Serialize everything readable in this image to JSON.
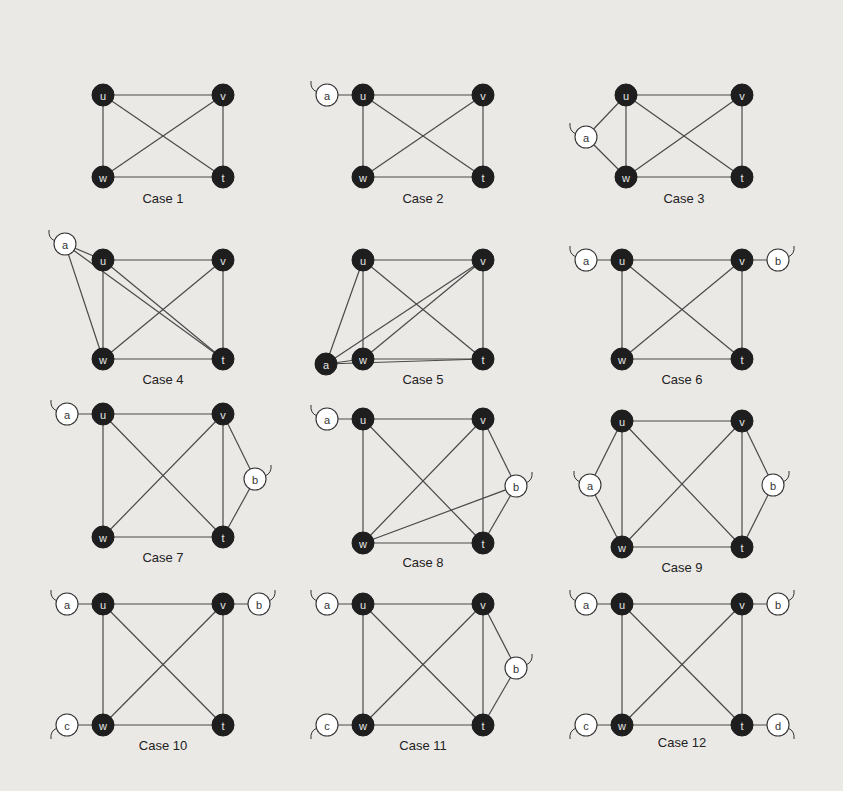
{
  "figure": {
    "core_vertices": [
      "u",
      "v",
      "w",
      "t"
    ],
    "colors": {
      "dark_node": "#1e1e1e",
      "light_node": "#ffffff",
      "edge": "#4a4a4a",
      "background": "#ebe9e6"
    },
    "cases": [
      {
        "label": "Case 1",
        "nodes": [
          {
            "id": "u",
            "x": 103,
            "y": 95,
            "dark": true
          },
          {
            "id": "v",
            "x": 223,
            "y": 95,
            "dark": true
          },
          {
            "id": "w",
            "x": 103,
            "y": 177,
            "dark": true
          },
          {
            "id": "t",
            "x": 223,
            "y": 177,
            "dark": true
          }
        ],
        "edges": [
          [
            "u",
            "v"
          ],
          [
            "u",
            "w"
          ],
          [
            "u",
            "t"
          ],
          [
            "v",
            "w"
          ],
          [
            "v",
            "t"
          ],
          [
            "w",
            "t"
          ]
        ],
        "caption": {
          "x": 163,
          "y": 203
        }
      },
      {
        "label": "Case 2",
        "nodes": [
          {
            "id": "a",
            "x": 327,
            "y": 95,
            "dark": false,
            "tail": "ul"
          },
          {
            "id": "u",
            "x": 363,
            "y": 95,
            "dark": true
          },
          {
            "id": "v",
            "x": 483,
            "y": 95,
            "dark": true
          },
          {
            "id": "w",
            "x": 363,
            "y": 177,
            "dark": true
          },
          {
            "id": "t",
            "x": 483,
            "y": 177,
            "dark": true
          }
        ],
        "edges": [
          [
            "a",
            "u"
          ],
          [
            "u",
            "v"
          ],
          [
            "u",
            "w"
          ],
          [
            "u",
            "t"
          ],
          [
            "v",
            "w"
          ],
          [
            "v",
            "t"
          ],
          [
            "w",
            "t"
          ]
        ],
        "caption": {
          "x": 423,
          "y": 203
        }
      },
      {
        "label": "Case 3",
        "nodes": [
          {
            "id": "a",
            "x": 586,
            "y": 137,
            "dark": false,
            "tail": "ul"
          },
          {
            "id": "u",
            "x": 626,
            "y": 95,
            "dark": true
          },
          {
            "id": "v",
            "x": 742,
            "y": 95,
            "dark": true
          },
          {
            "id": "w",
            "x": 626,
            "y": 177,
            "dark": true
          },
          {
            "id": "t",
            "x": 742,
            "y": 177,
            "dark": true
          }
        ],
        "edges": [
          [
            "a",
            "u"
          ],
          [
            "a",
            "w"
          ],
          [
            "u",
            "v"
          ],
          [
            "u",
            "w"
          ],
          [
            "u",
            "t"
          ],
          [
            "v",
            "w"
          ],
          [
            "v",
            "t"
          ],
          [
            "w",
            "t"
          ]
        ],
        "caption": {
          "x": 684,
          "y": 203
        }
      },
      {
        "label": "Case 4",
        "nodes": [
          {
            "id": "a",
            "x": 65,
            "y": 244,
            "dark": false,
            "tail": "ul"
          },
          {
            "id": "u",
            "x": 103,
            "y": 260,
            "dark": true
          },
          {
            "id": "v",
            "x": 223,
            "y": 260,
            "dark": true
          },
          {
            "id": "w",
            "x": 103,
            "y": 359,
            "dark": true
          },
          {
            "id": "t",
            "x": 223,
            "y": 359,
            "dark": true
          }
        ],
        "edges": [
          [
            "a",
            "u"
          ],
          [
            "a",
            "w"
          ],
          [
            "a",
            "t"
          ],
          [
            "u",
            "v"
          ],
          [
            "u",
            "w"
          ],
          [
            "u",
            "t"
          ],
          [
            "v",
            "w"
          ],
          [
            "v",
            "t"
          ],
          [
            "w",
            "t"
          ]
        ],
        "caption": {
          "x": 163,
          "y": 384
        }
      },
      {
        "label": "Case 5",
        "nodes": [
          {
            "id": "a",
            "x": 326,
            "y": 364,
            "dark": true
          },
          {
            "id": "u",
            "x": 363,
            "y": 260,
            "dark": true
          },
          {
            "id": "v",
            "x": 483,
            "y": 260,
            "dark": true
          },
          {
            "id": "w",
            "x": 363,
            "y": 359,
            "dark": true
          },
          {
            "id": "t",
            "x": 483,
            "y": 359,
            "dark": true
          }
        ],
        "edges": [
          [
            "a",
            "u"
          ],
          [
            "a",
            "w"
          ],
          [
            "a",
            "v"
          ],
          [
            "a",
            "t"
          ],
          [
            "u",
            "v"
          ],
          [
            "u",
            "w"
          ],
          [
            "u",
            "t"
          ],
          [
            "v",
            "w"
          ],
          [
            "v",
            "t"
          ],
          [
            "w",
            "t"
          ]
        ],
        "caption": {
          "x": 423,
          "y": 384
        }
      },
      {
        "label": "Case 6",
        "nodes": [
          {
            "id": "a",
            "x": 586,
            "y": 260,
            "dark": false,
            "tail": "ul"
          },
          {
            "id": "u",
            "x": 622,
            "y": 260,
            "dark": true
          },
          {
            "id": "v",
            "x": 742,
            "y": 260,
            "dark": true
          },
          {
            "id": "b",
            "x": 778,
            "y": 260,
            "dark": false,
            "tail": "ur"
          },
          {
            "id": "w",
            "x": 622,
            "y": 359,
            "dark": true
          },
          {
            "id": "t",
            "x": 742,
            "y": 359,
            "dark": true
          }
        ],
        "edges": [
          [
            "a",
            "u"
          ],
          [
            "v",
            "b"
          ],
          [
            "u",
            "v"
          ],
          [
            "u",
            "w"
          ],
          [
            "u",
            "t"
          ],
          [
            "v",
            "w"
          ],
          [
            "v",
            "t"
          ],
          [
            "w",
            "t"
          ]
        ],
        "caption": {
          "x": 682,
          "y": 384
        }
      },
      {
        "label": "Case 7",
        "nodes": [
          {
            "id": "a",
            "x": 67,
            "y": 414,
            "dark": false,
            "tail": "ul"
          },
          {
            "id": "u",
            "x": 103,
            "y": 414,
            "dark": true
          },
          {
            "id": "v",
            "x": 223,
            "y": 414,
            "dark": true
          },
          {
            "id": "b",
            "x": 255,
            "y": 479,
            "dark": false,
            "tail": "ur"
          },
          {
            "id": "w",
            "x": 103,
            "y": 537,
            "dark": true
          },
          {
            "id": "t",
            "x": 223,
            "y": 537,
            "dark": true
          }
        ],
        "edges": [
          [
            "a",
            "u"
          ],
          [
            "v",
            "b"
          ],
          [
            "b",
            "t"
          ],
          [
            "u",
            "v"
          ],
          [
            "u",
            "w"
          ],
          [
            "u",
            "t"
          ],
          [
            "v",
            "w"
          ],
          [
            "v",
            "t"
          ],
          [
            "w",
            "t"
          ]
        ],
        "caption": {
          "x": 163,
          "y": 562
        }
      },
      {
        "label": "Case 8",
        "nodes": [
          {
            "id": "a",
            "x": 327,
            "y": 419,
            "dark": false,
            "tail": "ul"
          },
          {
            "id": "u",
            "x": 363,
            "y": 419,
            "dark": true
          },
          {
            "id": "v",
            "x": 483,
            "y": 419,
            "dark": true
          },
          {
            "id": "b",
            "x": 516,
            "y": 486,
            "dark": false,
            "tail": "ur"
          },
          {
            "id": "w",
            "x": 363,
            "y": 543,
            "dark": true
          },
          {
            "id": "t",
            "x": 483,
            "y": 543,
            "dark": true
          }
        ],
        "edges": [
          [
            "a",
            "u"
          ],
          [
            "v",
            "b"
          ],
          [
            "b",
            "t"
          ],
          [
            "b",
            "w"
          ],
          [
            "u",
            "v"
          ],
          [
            "u",
            "w"
          ],
          [
            "u",
            "t"
          ],
          [
            "v",
            "w"
          ],
          [
            "v",
            "t"
          ],
          [
            "w",
            "t"
          ]
        ],
        "caption": {
          "x": 423,
          "y": 567
        }
      },
      {
        "label": "Case 9",
        "nodes": [
          {
            "id": "a",
            "x": 590,
            "y": 485,
            "dark": false,
            "tail": "ul"
          },
          {
            "id": "u",
            "x": 622,
            "y": 421,
            "dark": true
          },
          {
            "id": "v",
            "x": 742,
            "y": 421,
            "dark": true
          },
          {
            "id": "b",
            "x": 773,
            "y": 485,
            "dark": false,
            "tail": "ur"
          },
          {
            "id": "w",
            "x": 622,
            "y": 547,
            "dark": true
          },
          {
            "id": "t",
            "x": 742,
            "y": 547,
            "dark": true
          }
        ],
        "edges": [
          [
            "a",
            "u"
          ],
          [
            "a",
            "w"
          ],
          [
            "v",
            "b"
          ],
          [
            "b",
            "t"
          ],
          [
            "u",
            "v"
          ],
          [
            "u",
            "w"
          ],
          [
            "u",
            "t"
          ],
          [
            "v",
            "w"
          ],
          [
            "v",
            "t"
          ],
          [
            "w",
            "t"
          ]
        ],
        "caption": {
          "x": 682,
          "y": 572
        }
      },
      {
        "label": "Case 10",
        "nodes": [
          {
            "id": "a",
            "x": 67,
            "y": 604,
            "dark": false,
            "tail": "ul"
          },
          {
            "id": "u",
            "x": 103,
            "y": 604,
            "dark": true
          },
          {
            "id": "v",
            "x": 223,
            "y": 604,
            "dark": true
          },
          {
            "id": "b",
            "x": 259,
            "y": 604,
            "dark": false,
            "tail": "ur"
          },
          {
            "id": "c",
            "x": 67,
            "y": 725,
            "dark": false,
            "tail": "ll"
          },
          {
            "id": "w",
            "x": 103,
            "y": 725,
            "dark": true
          },
          {
            "id": "t",
            "x": 223,
            "y": 725,
            "dark": true
          }
        ],
        "edges": [
          [
            "a",
            "u"
          ],
          [
            "v",
            "b"
          ],
          [
            "c",
            "w"
          ],
          [
            "u",
            "v"
          ],
          [
            "u",
            "w"
          ],
          [
            "u",
            "t"
          ],
          [
            "v",
            "w"
          ],
          [
            "v",
            "t"
          ],
          [
            "w",
            "t"
          ]
        ],
        "caption": {
          "x": 163,
          "y": 750
        }
      },
      {
        "label": "Case 11",
        "nodes": [
          {
            "id": "a",
            "x": 327,
            "y": 604,
            "dark": false,
            "tail": "ul"
          },
          {
            "id": "u",
            "x": 363,
            "y": 604,
            "dark": true
          },
          {
            "id": "v",
            "x": 483,
            "y": 604,
            "dark": true
          },
          {
            "id": "b",
            "x": 516,
            "y": 668,
            "dark": false,
            "tail": "ur"
          },
          {
            "id": "c",
            "x": 327,
            "y": 725,
            "dark": false,
            "tail": "ll"
          },
          {
            "id": "w",
            "x": 363,
            "y": 725,
            "dark": true
          },
          {
            "id": "t",
            "x": 483,
            "y": 725,
            "dark": true
          }
        ],
        "edges": [
          [
            "a",
            "u"
          ],
          [
            "v",
            "b"
          ],
          [
            "b",
            "t"
          ],
          [
            "c",
            "w"
          ],
          [
            "u",
            "v"
          ],
          [
            "u",
            "w"
          ],
          [
            "u",
            "t"
          ],
          [
            "v",
            "w"
          ],
          [
            "v",
            "t"
          ],
          [
            "w",
            "t"
          ]
        ],
        "caption": {
          "x": 423,
          "y": 750
        }
      },
      {
        "label": "Case 12",
        "nodes": [
          {
            "id": "a",
            "x": 586,
            "y": 604,
            "dark": false,
            "tail": "ul"
          },
          {
            "id": "u",
            "x": 622,
            "y": 604,
            "dark": true
          },
          {
            "id": "v",
            "x": 742,
            "y": 604,
            "dark": true
          },
          {
            "id": "b",
            "x": 778,
            "y": 604,
            "dark": false,
            "tail": "ur"
          },
          {
            "id": "c",
            "x": 586,
            "y": 725,
            "dark": false,
            "tail": "ll"
          },
          {
            "id": "w",
            "x": 622,
            "y": 725,
            "dark": true
          },
          {
            "id": "t",
            "x": 742,
            "y": 725,
            "dark": true
          },
          {
            "id": "d",
            "x": 778,
            "y": 725,
            "dark": false,
            "tail": "lr"
          }
        ],
        "edges": [
          [
            "a",
            "u"
          ],
          [
            "v",
            "b"
          ],
          [
            "c",
            "w"
          ],
          [
            "t",
            "d"
          ],
          [
            "u",
            "v"
          ],
          [
            "u",
            "w"
          ],
          [
            "u",
            "t"
          ],
          [
            "v",
            "w"
          ],
          [
            "v",
            "t"
          ],
          [
            "w",
            "t"
          ]
        ],
        "caption": {
          "x": 682,
          "y": 747
        }
      }
    ]
  }
}
